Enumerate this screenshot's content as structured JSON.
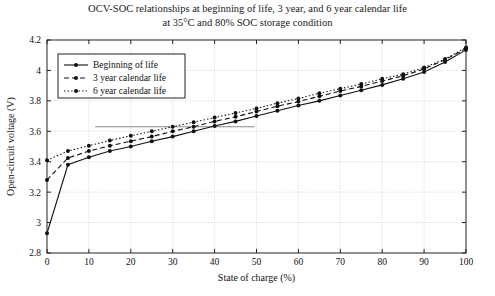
{
  "chart_data": {
    "type": "line",
    "title": "OCV-SOC relationships at beginning of life, 3 year, and 6 year calendar life",
    "subtitle": "at 35°C and 80% SOC storage condition",
    "xlabel": "State of charge (%)",
    "ylabel": "Open-circuit voltage (V)",
    "xlim": [
      0,
      100
    ],
    "ylim": [
      2.8,
      4.2
    ],
    "xticks": [
      0,
      10,
      20,
      30,
      40,
      50,
      60,
      70,
      80,
      90,
      100
    ],
    "xticklabels": [
      "0",
      "10",
      "20",
      "30",
      "40",
      "50",
      "60",
      "70",
      "80",
      "90",
      "100"
    ],
    "yticks": [
      2.8,
      3.0,
      3.2,
      3.4,
      3.6,
      3.8,
      4.0,
      4.2
    ],
    "yticklabels": [
      "2.8",
      "3",
      "3.2",
      "3.4",
      "3.6",
      "3.8",
      "4",
      "4.2"
    ],
    "grid": true,
    "grid_style": "dotted",
    "legend_position": "upper-left-inside",
    "x": [
      0,
      5,
      10,
      15,
      20,
      25,
      30,
      35,
      40,
      45,
      50,
      55,
      60,
      65,
      70,
      75,
      80,
      85,
      90,
      95,
      100
    ],
    "series": [
      {
        "name": "Beginning of life",
        "linestyle": "solid",
        "marker": "filled-circle",
        "color": "#111111",
        "values": [
          2.93,
          3.38,
          3.43,
          3.47,
          3.5,
          3.535,
          3.565,
          3.6,
          3.635,
          3.665,
          3.7,
          3.735,
          3.77,
          3.8,
          3.835,
          3.87,
          3.905,
          3.945,
          3.99,
          4.055,
          4.135
        ]
      },
      {
        "name": "3 year calendar life",
        "linestyle": "dashed",
        "marker": "filled-circle",
        "color": "#111111",
        "values": [
          3.28,
          3.425,
          3.47,
          3.505,
          3.535,
          3.565,
          3.6,
          3.63,
          3.665,
          3.695,
          3.73,
          3.765,
          3.795,
          3.83,
          3.865,
          3.895,
          3.93,
          3.965,
          4.01,
          4.07,
          4.145
        ]
      },
      {
        "name": "6 year calendar life",
        "linestyle": "dotted",
        "marker": "filled-circle",
        "color": "#111111",
        "values": [
          3.41,
          3.47,
          3.505,
          3.54,
          3.57,
          3.6,
          3.63,
          3.66,
          3.69,
          3.72,
          3.75,
          3.785,
          3.815,
          3.85,
          3.88,
          3.91,
          3.945,
          3.975,
          4.02,
          4.075,
          4.15
        ]
      }
    ],
    "annotations": [
      {
        "name": "horizontal-rule-artifact",
        "type": "hline",
        "y": 3.63,
        "x_start": 11.5,
        "x_end": 49.5,
        "color": "#8a8a8a"
      }
    ]
  }
}
